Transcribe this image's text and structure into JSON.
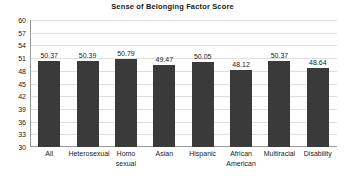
{
  "chart_data": {
    "type": "bar",
    "title": "Sense of Belonging Factor Score",
    "xlabel": "",
    "ylabel": "",
    "ylim": [
      30,
      60
    ],
    "ytick_step": 3,
    "yticks": [
      60,
      57,
      54,
      51,
      48,
      45,
      42,
      39,
      36,
      33,
      30
    ],
    "grid": true,
    "legend": false,
    "bar_color": "#3a3a3a",
    "gridline_color": "#dedede",
    "axis_color": "#9a9a9a",
    "categories": [
      "All",
      "Heterosexual",
      "Homo sexual",
      "Asian",
      "Hispanic",
      "African American",
      "Multiracial",
      "Disability"
    ],
    "category_lines": [
      [
        "All"
      ],
      [
        "Heterosexual"
      ],
      [
        "Homo",
        "sexual"
      ],
      [
        "Asian"
      ],
      [
        "Hispanic"
      ],
      [
        "African",
        "American"
      ],
      [
        "Multiracial"
      ],
      [
        "Disability"
      ]
    ],
    "values": [
      50.37,
      50.39,
      50.79,
      49.47,
      50.05,
      48.12,
      50.37,
      48.64
    ],
    "value_labels": [
      "50.37",
      "50.39",
      "50.79",
      "49.47",
      "50.05",
      "48.12",
      "50.37",
      "48.64"
    ]
  }
}
